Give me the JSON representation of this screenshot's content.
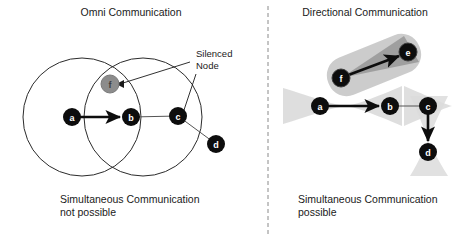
{
  "figure": {
    "width": 461,
    "height": 241,
    "background": "#ffffff"
  },
  "divider": {
    "name": "panel-divider",
    "x": 268,
    "y1": 6,
    "y2": 236,
    "style": "dashed",
    "color": "#8a8a8a"
  },
  "colors": {
    "node_active": "#0d0d0d",
    "node_silenced": "#8c8c8c",
    "node_ring": "#0d0d0d",
    "beam_light": "#d8d8d8",
    "beam_mid": "#c3c3c3",
    "beam_dark": "#9a9a9a",
    "circle_stroke": "#2b2b2b",
    "arrow_bold": "#0d0d0d",
    "arrow_thin": "#555555",
    "text": "#1a1a1a",
    "divider": "#8a8a8a"
  },
  "left_panel": {
    "name": "omni-communication-panel",
    "title": "Omni Communication",
    "title_pos": {
      "x": 131,
      "y": 16
    },
    "caption": [
      "Simultaneous Communication",
      "not possible"
    ],
    "caption_pos": {
      "x": 60,
      "y": 203
    },
    "annotation": {
      "label": [
        "Silenced",
        "Node"
      ],
      "pos": {
        "x": 196,
        "y": 57
      },
      "leaders": [
        {
          "name": "leader-to-silenced-node",
          "from": {
            "x": 192,
            "y": 62
          },
          "to": {
            "x": 121,
            "y": 84
          }
        },
        {
          "name": "leader-to-node-c",
          "from": {
            "x": 196,
            "y": 74
          },
          "to": {
            "x": 184,
            "y": 110
          }
        }
      ]
    },
    "circles": [
      {
        "name": "range-circle-a",
        "cx": 82,
        "cy": 117,
        "r": 59
      },
      {
        "name": "range-circle-b",
        "cx": 143,
        "cy": 117,
        "r": 59
      }
    ],
    "nodes": [
      {
        "id": "a",
        "label": "a",
        "x": 72,
        "y": 117,
        "r": 9,
        "state": "active"
      },
      {
        "id": "b",
        "label": "b",
        "x": 131,
        "y": 117,
        "r": 9,
        "state": "active"
      },
      {
        "id": "c",
        "label": "c",
        "x": 178,
        "y": 116,
        "r": 9,
        "state": "active"
      },
      {
        "id": "d",
        "label": "d",
        "x": 216,
        "y": 144,
        "r": 9,
        "state": "active"
      },
      {
        "id": "f",
        "label": "f",
        "x": 110,
        "y": 84,
        "r": 9,
        "state": "silenced"
      }
    ],
    "links": [
      {
        "name": "link-a-to-b",
        "from": "a",
        "to": "b",
        "weight": "bold",
        "arrow": true
      },
      {
        "name": "link-b-to-c",
        "from": "b",
        "to": "c",
        "weight": "thin",
        "arrow": false
      },
      {
        "name": "link-c-to-d",
        "from": "c",
        "to": "d",
        "weight": "thin",
        "arrow": false
      }
    ]
  },
  "right_panel": {
    "name": "directional-communication-panel",
    "title": "Directional Communication",
    "title_pos": {
      "x": 365,
      "y": 16
    },
    "caption": [
      "Simultaneous Communication",
      "possible"
    ],
    "caption_pos": {
      "x": 298,
      "y": 203
    },
    "beams": [
      {
        "name": "beam-f-to-e",
        "type": "rounded-rect",
        "cx": 374,
        "cy": 65,
        "w": 98,
        "h": 40,
        "rotate": -22,
        "shade": "#c9c9c9"
      },
      {
        "name": "beam-cone-f-to-e",
        "type": "cone",
        "from": {
          "x": 341,
          "y": 78
        },
        "to": {
          "x": 408,
          "y": 52
        },
        "spread": 17,
        "shade": "#9a9a9a"
      },
      {
        "name": "beam-a-to-b",
        "type": "bowtie",
        "from": {
          "x": 320,
          "y": 106
        },
        "to": {
          "x": 390,
          "y": 106
        },
        "spread": 25,
        "shade": "#dcdcdc"
      },
      {
        "name": "beam-b-to-c",
        "type": "bowtie",
        "from": {
          "x": 390,
          "y": 106
        },
        "to": {
          "x": 452,
          "y": 106
        },
        "spread": 23,
        "shade": "#dcdcdc"
      },
      {
        "name": "beam-c-to-d",
        "type": "bowtie",
        "from": {
          "x": 428,
          "y": 106
        },
        "to": {
          "x": 428,
          "y": 160
        },
        "spread": 21,
        "shade": "#dcdcdc"
      }
    ],
    "nodes": [
      {
        "id": "a",
        "label": "a",
        "x": 320,
        "y": 106,
        "r": 9,
        "state": "active"
      },
      {
        "id": "b",
        "label": "b",
        "x": 390,
        "y": 106,
        "r": 9,
        "state": "active"
      },
      {
        "id": "c",
        "label": "c",
        "x": 428,
        "y": 106,
        "r": 9,
        "state": "active"
      },
      {
        "id": "d",
        "label": "d",
        "x": 428,
        "y": 152,
        "r": 9,
        "state": "active"
      },
      {
        "id": "e",
        "label": "e",
        "x": 408,
        "y": 52,
        "r": 9,
        "state": "active"
      },
      {
        "id": "f",
        "label": "f",
        "x": 341,
        "y": 78,
        "r": 9,
        "state": "active"
      }
    ],
    "links": [
      {
        "name": "link-f-to-e",
        "from": "f",
        "to": "e",
        "weight": "bold",
        "arrow": true
      },
      {
        "name": "link-a-to-b",
        "from": "a",
        "to": "b",
        "weight": "bold",
        "arrow": true
      },
      {
        "name": "link-b-to-c",
        "from": "b",
        "to": "c",
        "weight": "thin",
        "arrow": false
      },
      {
        "name": "link-c-to-d",
        "from": "c",
        "to": "d",
        "weight": "bold",
        "arrow": true
      }
    ]
  }
}
